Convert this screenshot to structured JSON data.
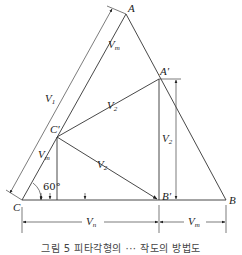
{
  "figure": {
    "points": {
      "A": "A",
      "A_prime": "A′",
      "B": "B",
      "B_prime": "B′",
      "C": "C",
      "C_prime": "C′"
    },
    "labels": {
      "V1": "V",
      "V1_sub": "1",
      "V2_upper": "V",
      "V2_upper_sub": "2",
      "V2_vertical": "V",
      "V2_vertical_sub": "2",
      "V2_lower": "V",
      "V2_lower_sub": "2",
      "Vm_top": "V",
      "Vm_top_sub": "m",
      "Vm_left": "V",
      "Vm_left_sub": "m",
      "Vn_bottom": "V",
      "Vn_bottom_sub": "n",
      "Vm_bottom": "V",
      "Vm_bottom_sub": "m",
      "angle": "60°"
    },
    "caption": "그림 5 피타각형의 ··· 작도의 방법도"
  }
}
